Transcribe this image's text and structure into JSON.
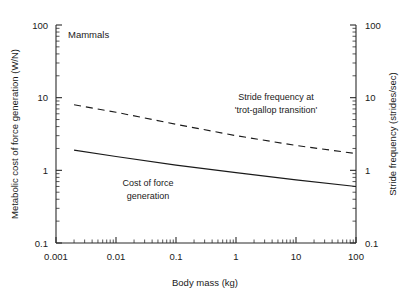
{
  "chart_data": {
    "type": "line",
    "title": "",
    "panel_label": "Mammals",
    "xlabel": "Body mass (kg)",
    "ylabel": "Metabolic cost of force generation (W/N)",
    "y2label": "Stride frequency (strides/sec)",
    "xscale": "log",
    "yscale": "log",
    "xlim": [
      0.001,
      100
    ],
    "ylim": [
      0.1,
      100
    ],
    "y2lim": [
      0.1,
      100
    ],
    "grid": false,
    "legend": "inline-annotations",
    "xticks": [
      "0.001",
      "0.01",
      "0.1",
      "1",
      "10",
      "100"
    ],
    "xtick_values": [
      0.001,
      0.01,
      0.1,
      1,
      10,
      100
    ],
    "yticks": [
      "100",
      "10",
      "1",
      "0.1"
    ],
    "ytick_values": [
      100,
      10,
      1,
      0.1
    ],
    "y2ticks": [
      "100",
      "10",
      "1",
      "0.1"
    ],
    "y2tick_values": [
      100,
      10,
      1,
      0.1
    ],
    "series": [
      {
        "name": "Stride frequency at 'trot-gallop transition'",
        "style": "dashed",
        "axis": "right",
        "x": [
          0.002,
          0.01,
          0.1,
          1,
          10,
          100
        ],
        "y": [
          8.0,
          6.3,
          4.3,
          3.0,
          2.2,
          1.7
        ]
      },
      {
        "name": "Cost of force generation",
        "style": "solid",
        "axis": "left",
        "x": [
          0.002,
          0.01,
          0.1,
          1,
          10,
          100
        ],
        "y": [
          1.9,
          1.55,
          1.18,
          0.93,
          0.74,
          0.6
        ]
      }
    ],
    "annotations": [
      {
        "text_line1": "Stride frequency at",
        "text_line2": "'trot-gallop transition'"
      },
      {
        "text_line1": "Cost of force",
        "text_line2": "generation"
      }
    ]
  },
  "axes": {
    "x_title": "Body mass (kg)",
    "y_left_title": "Metabolic cost of force generation (W/N)",
    "y_right_title": "Stride frequency (strides/sec)"
  },
  "labels": {
    "panel": "Mammals",
    "stride_annot_1": "Stride frequency at",
    "stride_annot_2": "'trot-gallop transition'",
    "cost_annot_1": "Cost of force",
    "cost_annot_2": "generation"
  },
  "colors": {
    "ink": "#1a1a1a",
    "axis": "#2b2b2b",
    "background": "#ffffff"
  }
}
